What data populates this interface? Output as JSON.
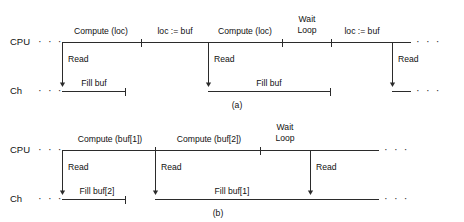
{
  "figure": {
    "line_color": "#2b2b2b",
    "background": "#ffffff",
    "ellipsis": "· · ·"
  },
  "panels": [
    {
      "id": "a",
      "caption": "(a)",
      "rows": [
        {
          "id": "cpu",
          "label": "CPU"
        },
        {
          "id": "ch",
          "label": "Ch"
        }
      ],
      "cpu_segments": [
        {
          "label": "Compute (loc)",
          "start": 62,
          "end": 141
        },
        {
          "label": "loc := buf",
          "start": 141,
          "end": 208
        },
        {
          "label": "Compute (loc)",
          "start": 208,
          "end": 282
        },
        {
          "label": "Wait Loop",
          "start": 282,
          "end": 331,
          "two_line": true
        },
        {
          "label": "loc := buf",
          "start": 331,
          "end": 392
        }
      ],
      "ch_segments": [
        {
          "label": "Fill buf",
          "start": 62,
          "end": 126
        },
        {
          "label": "Fill buf",
          "start": 208,
          "end": 331
        }
      ],
      "read_arrows": [
        {
          "label": "Read",
          "x": 62
        },
        {
          "label": "Read",
          "x": 208
        },
        {
          "label": "Read",
          "x": 392
        }
      ]
    },
    {
      "id": "b",
      "caption": "(b)",
      "rows": [
        {
          "id": "cpu",
          "label": "CPU"
        },
        {
          "id": "ch",
          "label": "Ch"
        }
      ],
      "cpu_segments": [
        {
          "label": "Compute (buf[1])",
          "start": 62,
          "end": 155
        },
        {
          "label": "Compute (buf[2])",
          "start": 155,
          "end": 260
        },
        {
          "label": "Wait Loop",
          "start": 260,
          "end": 310,
          "two_line": true
        }
      ],
      "ch_segments": [
        {
          "label": "Fill buf[2]",
          "start": 62,
          "end": 126
        },
        {
          "label": "Fill buf[1]",
          "start": 155,
          "end": 310
        }
      ],
      "read_arrows": [
        {
          "label": "Read",
          "x": 62
        },
        {
          "label": "Read",
          "x": 155
        },
        {
          "label": "Read",
          "x": 310
        }
      ]
    }
  ],
  "text": {
    "panel_a": {
      "cpu_row_label": "CPU",
      "ch_row_label": "Ch",
      "compute_1": "Compute (loc)",
      "loc_assign_1": "loc := buf",
      "compute_2": "Compute (loc)",
      "wait_line1": "Wait",
      "wait_line2": "Loop",
      "loc_assign_2": "loc := buf",
      "read_1": "Read",
      "read_2": "Read",
      "read_3": "Read",
      "fill_1": "Fill buf",
      "fill_2": "Fill buf",
      "caption": "(a)"
    },
    "panel_b": {
      "cpu_row_label": "CPU",
      "ch_row_label": "Ch",
      "compute_1": "Compute (buf[1])",
      "compute_2": "Compute (buf[2])",
      "wait_line1": "Wait",
      "wait_line2": "Loop",
      "read_1": "Read",
      "read_2": "Read",
      "read_3": "Read",
      "fill_1": "Fill buf[2]",
      "fill_2": "Fill buf[1]",
      "caption": "(b)"
    }
  }
}
